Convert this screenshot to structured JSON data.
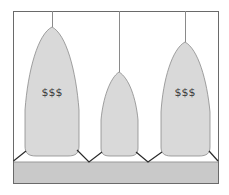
{
  "diagram": {
    "colors": {
      "background": "#ffffff",
      "frame": "#6a6a6a",
      "pod_fill": "#d9d9d9",
      "pod_stroke": "#8a8a8a",
      "string": "#8a8a8a",
      "base_fill": "#c9c9c9",
      "zigzag": "#2a2a2a",
      "label": "#3a3a3a"
    },
    "pods": [
      {
        "id": "pod-left",
        "label": "$$$",
        "size": "large"
      },
      {
        "id": "pod-middle",
        "label": "",
        "size": "small"
      },
      {
        "id": "pod-right",
        "label": "$$$",
        "size": "large"
      }
    ]
  }
}
